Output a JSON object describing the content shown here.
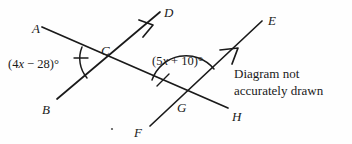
{
  "diagram": {
    "note": {
      "line1": "Diagram not",
      "line2": "accurately drawn"
    },
    "stroke_color": "#1a1a1a",
    "background_color": "#fefefe",
    "points": [
      {
        "id": "A",
        "label": "A",
        "x": 32,
        "y": 22
      },
      {
        "id": "B",
        "label": "B",
        "x": 42,
        "y": 103
      },
      {
        "id": "C",
        "label": "C",
        "x": 101,
        "y": 44
      },
      {
        "id": "D",
        "label": "D",
        "x": 164,
        "y": 6
      },
      {
        "id": "E",
        "label": "E",
        "x": 268,
        "y": 14
      },
      {
        "id": "F",
        "label": "F",
        "x": 134,
        "y": 126
      },
      {
        "id": "G",
        "label": "G",
        "x": 177,
        "y": 101
      },
      {
        "id": "H",
        "label": "H",
        "x": 232,
        "y": 110
      }
    ],
    "angles": [
      {
        "id": "angle-at-C",
        "vertex": "C",
        "expression_prefix": "(4",
        "variable": "x",
        "expression_suffix": " − 28)°",
        "full_text": "(4x − 28)°",
        "label_x": 8,
        "label_y": 58
      },
      {
        "id": "angle-at-G",
        "vertex": "G",
        "expression_prefix": "(5",
        "variable": "x",
        "expression_suffix": " + 10)°",
        "full_text": "(5x + 10)°",
        "label_x": 152,
        "label_y": 55
      }
    ],
    "lines": [
      {
        "id": "line-AH",
        "name": "transversal-A-to-H",
        "from": "A",
        "to": "H"
      },
      {
        "id": "line-BD",
        "name": "ray-B-to-D",
        "from": "B",
        "to": "D",
        "arrow": true
      },
      {
        "id": "line-FE",
        "name": "ray-F-to-E",
        "from": "F",
        "to": "E",
        "arrow": true
      }
    ]
  }
}
